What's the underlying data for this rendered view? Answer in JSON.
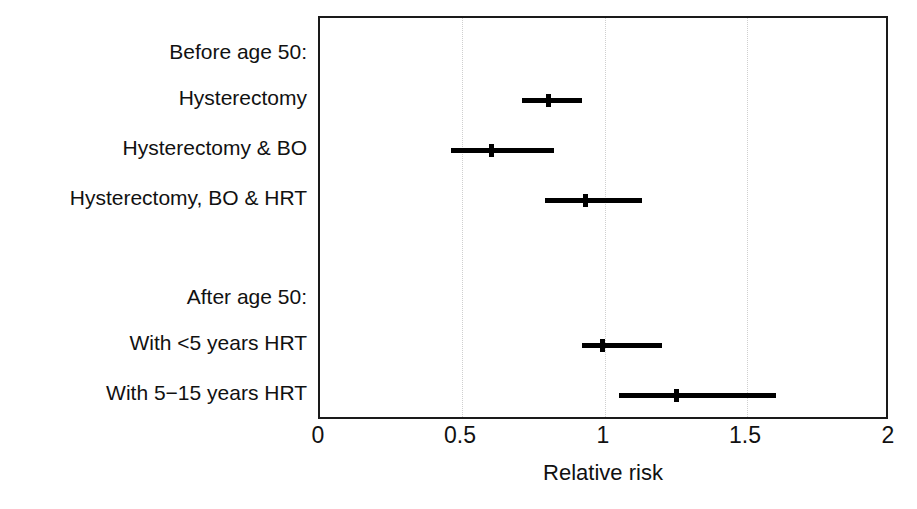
{
  "chart_data": {
    "type": "forest",
    "title": "",
    "xlabel": "Relative risk",
    "ylabel": "",
    "xlim": [
      0,
      2
    ],
    "xticks": [
      "0",
      "0.5",
      "1",
      "1.5",
      "2"
    ],
    "xtick_values": [
      0,
      0.5,
      1,
      1.5,
      2
    ],
    "grid": "vertical dotted at 0.5, 1, 1.5",
    "legend": "none",
    "group_headers": [
      "Before age 50:",
      "After age 50:"
    ],
    "rows": [
      {
        "kind": "header",
        "label": "Before age 50:",
        "estimate": null,
        "ci_low": null,
        "ci_high": null
      },
      {
        "kind": "data",
        "label": "Hysterectomy",
        "estimate": 0.8,
        "ci_low": 0.71,
        "ci_high": 0.92
      },
      {
        "kind": "data",
        "label": "Hysterectomy & BO",
        "estimate": 0.6,
        "ci_low": 0.46,
        "ci_high": 0.82
      },
      {
        "kind": "data",
        "label": "Hysterectomy, BO & HRT",
        "estimate": 0.93,
        "ci_low": 0.79,
        "ci_high": 1.13
      },
      {
        "kind": "header",
        "label": "After age 50:",
        "estimate": null,
        "ci_low": null,
        "ci_high": null
      },
      {
        "kind": "data",
        "label": "With <5 years HRT",
        "estimate": 0.99,
        "ci_low": 0.92,
        "ci_high": 1.2
      },
      {
        "kind": "data",
        "label": "With 5−15 years HRT",
        "estimate": 1.25,
        "ci_low": 1.05,
        "ci_high": 1.6
      }
    ],
    "colors": {
      "marker": "#000000",
      "ci_line": "#000000",
      "axis": "#1a1a1a",
      "grid": "#cfcfcf",
      "background": "#ffffff"
    }
  },
  "labels": {
    "row0": "Before age 50:",
    "row1": "Hysterectomy",
    "row2": "Hysterectomy & BO",
    "row3": "Hysterectomy, BO & HRT",
    "row4": "After age 50:",
    "row5": "With <5 years HRT",
    "row6": "With 5−15 years HRT"
  },
  "axis": {
    "title": "Relative risk",
    "tick0": "0",
    "tick1": "0.5",
    "tick2": "1",
    "tick3": "1.5",
    "tick4": "2"
  }
}
